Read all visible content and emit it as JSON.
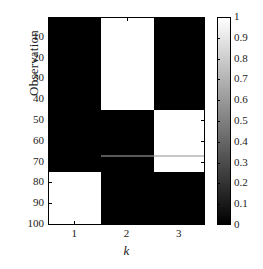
{
  "chart_data": {
    "type": "heatmap",
    "title": "",
    "xlabel": "k",
    "ylabel": "Observation",
    "xticks": [
      "1",
      "2",
      "3"
    ],
    "x_categories": [
      1,
      2,
      3
    ],
    "yticks": [
      "10",
      "20",
      "30",
      "40",
      "50",
      "60",
      "70",
      "80",
      "90",
      "100"
    ],
    "ytick_values": [
      10,
      20,
      30,
      40,
      50,
      60,
      70,
      80,
      90,
      100
    ],
    "ylim": [
      0.5,
      100.5
    ],
    "xlim": [
      0.5,
      3.5
    ],
    "y_inverted": true,
    "grid": false,
    "colormap": "gray",
    "clim": [
      0,
      1
    ],
    "colorbar": {
      "position": "right",
      "min_label": "0",
      "max_label": "1",
      "ticks": [
        "0",
        "0.1",
        "0.2",
        "0.3",
        "0.4",
        "0.5",
        "0.6",
        "0.7",
        "0.8",
        "0.9",
        "1"
      ],
      "tick_values": [
        0,
        0.1,
        0.2,
        0.3,
        0.4,
        0.5,
        0.6,
        0.7,
        0.8,
        0.9,
        1
      ]
    },
    "blocks": [
      {
        "label": "k2-white-top",
        "column": 2,
        "y_start": 0.5,
        "y_end": 44.5,
        "value": 1
      },
      {
        "label": "k3-white-mid",
        "column": 3,
        "y_start": 44.5,
        "y_end": 66.5,
        "value": 1
      },
      {
        "label": "k2-gray-row",
        "column": 2,
        "y_start": 66.5,
        "y_end": 67.5,
        "value": 0.35
      },
      {
        "label": "k3-gray-row",
        "column": 3,
        "y_start": 66.5,
        "y_end": 67.5,
        "value": 0.78
      },
      {
        "label": "k3-white-low",
        "column": 3,
        "y_start": 67.5,
        "y_end": 74.5,
        "value": 1
      },
      {
        "label": "k1-white-bot",
        "column": 1,
        "y_start": 74.5,
        "y_end": 100.5,
        "value": 1
      }
    ],
    "background_value": 0
  }
}
